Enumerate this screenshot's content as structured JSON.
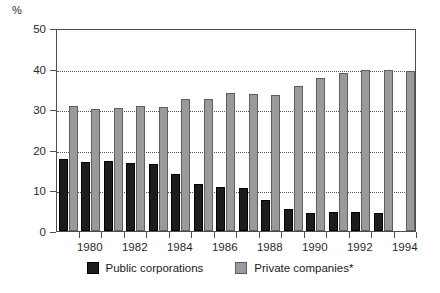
{
  "chart_data": {
    "type": "bar",
    "title": "",
    "subtitle": "",
    "xlabel": "",
    "ylabel": "%",
    "unit_label": "%",
    "ylim": [
      0,
      50
    ],
    "yticks": [
      0,
      10,
      20,
      30,
      40,
      50
    ],
    "ytick_labels": [
      "0",
      "10",
      "20",
      "30",
      "40",
      "50"
    ],
    "grid": true,
    "grid_axis": "y",
    "legend_position": "bottom-center",
    "x": [
      1979,
      1980,
      1981,
      1982,
      1983,
      1984,
      1985,
      1986,
      1987,
      1988,
      1989,
      1990,
      1991,
      1992,
      1993,
      1994
    ],
    "categories": [
      "1979",
      "1980",
      "1981",
      "1982",
      "1983",
      "1984",
      "1985",
      "1986",
      "1987",
      "1988",
      "1989",
      "1990",
      "1991",
      "1992",
      "1993",
      "1994"
    ],
    "xtick_labels": [
      "1980",
      "1982",
      "1984",
      "1986",
      "1988",
      "1990",
      "1992",
      "1994"
    ],
    "xticks": [
      1980,
      1982,
      1984,
      1986,
      1988,
      1990,
      1992,
      1994
    ],
    "series": [
      {
        "name": "Public corporations",
        "color": "#1c1c1c",
        "values": [
          17.7,
          17.1,
          17.2,
          16.8,
          16.5,
          14.1,
          11.6,
          10.9,
          10.5,
          7.7,
          5.5,
          4.5,
          4.6,
          4.7,
          4.4,
          0
        ]
      },
      {
        "name": "Private companies*",
        "color": "#9a9a9a",
        "values": [
          30.8,
          30.0,
          30.4,
          30.7,
          30.6,
          32.5,
          32.6,
          34.0,
          33.7,
          33.6,
          35.7,
          37.7,
          38.9,
          39.6,
          39.7,
          39.4
        ]
      }
    ]
  },
  "legend": {
    "items": [
      {
        "label": "Public corporations",
        "swatch": "black-square-swatch"
      },
      {
        "label": "Private companies*",
        "swatch": "gray-square-swatch"
      }
    ]
  }
}
